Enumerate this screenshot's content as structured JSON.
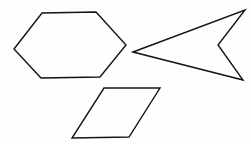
{
  "canvas": {
    "width": 251,
    "height": 144,
    "background_color": "#fefefe",
    "title": "Geometric shapes line drawing"
  },
  "style": {
    "stroke_color": "#141414",
    "stroke_width": 1.4,
    "fill": "none"
  },
  "shapes": [
    {
      "id": "hexagon",
      "name": "hexagon",
      "label": "Hexagon",
      "sides": 6,
      "points": "14,49 42,13 96,12 126,45 100,77 41,78",
      "vertices": [
        [
          14,
          49
        ],
        [
          42,
          13
        ],
        [
          96,
          12
        ],
        [
          126,
          45
        ],
        [
          100,
          77
        ],
        [
          41,
          78
        ]
      ]
    },
    {
      "id": "arrow-dart",
      "name": "arrow-dart",
      "label": "Concave arrow (dart)",
      "sides": 4,
      "points": "133,52 245,10 218,45 243,80",
      "vertices": [
        [
          133,
          52
        ],
        [
          245,
          10
        ],
        [
          218,
          45
        ],
        [
          243,
          80
        ]
      ]
    },
    {
      "id": "parallelogram",
      "name": "parallelogram",
      "label": "Parallelogram",
      "sides": 4,
      "points": "104,88 160,88 129,137 72,138",
      "vertices": [
        [
          104,
          88
        ],
        [
          160,
          88
        ],
        [
          129,
          137
        ],
        [
          72,
          138
        ]
      ]
    }
  ]
}
